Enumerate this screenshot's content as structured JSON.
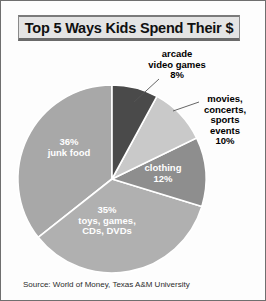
{
  "header": {
    "title": "Top 5 Ways Kids Spend Their $"
  },
  "source": {
    "text": "Source: World of Money, Texas A&M University"
  },
  "labels": {
    "arcade": "arcade\nvideo games\n8%",
    "arcade_name_line1": "arcade",
    "arcade_name_line2": "video games",
    "arcade_pct": "8%",
    "movies_line1": "movies,",
    "movies_line2": "concerts,",
    "movies_line3": "sports",
    "movies_line4": "events",
    "movies_pct": "10%",
    "junkfood_pct": "36%",
    "junkfood_name": "junk food",
    "clothing_name": "clothing",
    "clothing_pct": "12%",
    "toys_pct": "35%",
    "toys_line1": "toys, games,",
    "toys_line2": "CDs, DVDs"
  },
  "chart_data": {
    "type": "pie",
    "title": "Top 5 Ways Kids Spend Their $",
    "subtitle": "",
    "xlabel": "",
    "ylabel": "",
    "units": "percent",
    "total": 101,
    "legend_position": "none",
    "grid": false,
    "source": "Source: World of Money, Texas A&M University",
    "categories": [
      "junk food",
      "arcade video games",
      "movies, concerts, sports events",
      "clothing",
      "toys, games, CDs, DVDs"
    ],
    "values": [
      36,
      8,
      10,
      12,
      35
    ],
    "colors": [
      "#a8a8a8",
      "#4a4a4a",
      "#c9c9c9",
      "#8e8e8e",
      "#b0b0b0"
    ],
    "label_placement": [
      "inside",
      "outside",
      "outside",
      "inside",
      "inside"
    ],
    "slices": [
      {
        "label": "junk food",
        "value": 36,
        "display": "36%",
        "color": "#a8a8a8",
        "placement": "inside"
      },
      {
        "label": "arcade video games",
        "value": 8,
        "display": "8%",
        "color": "#4a4a4a",
        "placement": "outside"
      },
      {
        "label": "movies, concerts, sports events",
        "value": 10,
        "display": "10%",
        "color": "#c9c9c9",
        "placement": "outside"
      },
      {
        "label": "clothing",
        "value": 12,
        "display": "12%",
        "color": "#8e8e8e",
        "placement": "inside"
      },
      {
        "label": "toys, games, CDs, DVDs",
        "value": 35,
        "display": "35%",
        "color": "#b0b0b0",
        "placement": "inside"
      }
    ]
  }
}
